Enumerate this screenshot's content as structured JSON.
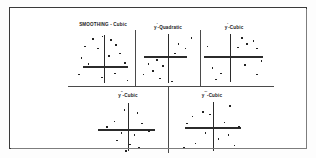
{
  "figure": {
    "kind": "trellis-scatter-panels",
    "panel_count": 5,
    "frame_color": "#3a3a3a",
    "point_color": "#222222",
    "axis_color": "#2b2b2b",
    "background": "#ffffff"
  },
  "chart_data": {
    "type": "scatter",
    "title": "SMOOTHING - Cubic",
    "xlabel": "",
    "ylabel": "",
    "grid": false,
    "legend": "none",
    "layout": "trellis 3 panels top row, 2 panels bottom row",
    "panels": [
      {
        "id": "panel-1",
        "title": "SMOOTHING - Cubic",
        "title_base": "SMOOTHING",
        "title_separator": " - ",
        "title_suffix": "Cubic",
        "primes": "",
        "axis_origin": {
          "x": 0.52,
          "y": 0.66
        },
        "axis_h_extent": [
          0.18,
          0.9
        ],
        "axis_v_extent": [
          0.05,
          0.98
        ],
        "points": [
          {
            "x": 0.33,
            "y": 0.12
          },
          {
            "x": 0.48,
            "y": 0.07
          },
          {
            "x": 0.62,
            "y": 0.14
          },
          {
            "x": 0.2,
            "y": 0.26
          },
          {
            "x": 0.41,
            "y": 0.3
          },
          {
            "x": 0.7,
            "y": 0.23
          },
          {
            "x": 0.14,
            "y": 0.48
          },
          {
            "x": 0.58,
            "y": 0.45
          },
          {
            "x": 0.76,
            "y": 0.4
          },
          {
            "x": 0.25,
            "y": 0.6
          },
          {
            "x": 0.84,
            "y": 0.58
          },
          {
            "x": 0.1,
            "y": 0.8
          },
          {
            "x": 0.47,
            "y": 0.86
          },
          {
            "x": 0.68,
            "y": 0.78
          },
          {
            "x": 0.88,
            "y": 0.92
          }
        ]
      },
      {
        "id": "panel-2",
        "title": "y'-Quadratic",
        "title_base": "y",
        "title_separator": "-",
        "title_suffix": "Quadratic",
        "primes": "'",
        "axis_origin": {
          "x": 0.5,
          "y": 0.46
        },
        "axis_h_extent": [
          0.1,
          0.82
        ],
        "axis_v_extent": [
          0.04,
          0.99
        ],
        "points": [
          {
            "x": 0.88,
            "y": 0.1
          },
          {
            "x": 0.66,
            "y": 0.22
          },
          {
            "x": 0.78,
            "y": 0.3
          },
          {
            "x": 0.6,
            "y": 0.4
          },
          {
            "x": 0.3,
            "y": 0.52
          },
          {
            "x": 0.16,
            "y": 0.6
          },
          {
            "x": 0.4,
            "y": 0.64
          },
          {
            "x": 0.24,
            "y": 0.74
          },
          {
            "x": 0.08,
            "y": 0.8
          },
          {
            "x": 0.35,
            "y": 0.88
          },
          {
            "x": 0.55,
            "y": 0.94
          }
        ]
      },
      {
        "id": "panel-3",
        "title": "y'-Cubic",
        "title_base": "y",
        "title_separator": "-",
        "title_suffix": "Cubic",
        "primes": "'",
        "axis_origin": {
          "x": 0.44,
          "y": 0.46
        },
        "axis_h_extent": [
          0.02,
          0.96
        ],
        "axis_v_extent": [
          0.04,
          0.96
        ],
        "points": [
          {
            "x": 0.62,
            "y": 0.1
          },
          {
            "x": 0.8,
            "y": 0.16
          },
          {
            "x": 0.7,
            "y": 0.22
          },
          {
            "x": 0.55,
            "y": 0.28
          },
          {
            "x": 0.86,
            "y": 0.3
          },
          {
            "x": 0.06,
            "y": 0.26
          },
          {
            "x": 0.93,
            "y": 0.54
          },
          {
            "x": 0.66,
            "y": 0.62
          },
          {
            "x": 0.14,
            "y": 0.68
          },
          {
            "x": 0.28,
            "y": 0.78
          },
          {
            "x": 0.86,
            "y": 0.8
          },
          {
            "x": 0.2,
            "y": 0.9
          }
        ]
      },
      {
        "id": "panel-4",
        "title": "y''-Cubic",
        "title_base": "y",
        "title_separator": "-",
        "title_suffix": "Cubic",
        "primes": "''",
        "axis_origin": {
          "x": 0.5,
          "y": 0.56
        },
        "axis_h_extent": [
          0.08,
          0.88
        ],
        "axis_v_extent": [
          0.06,
          0.98
        ],
        "points": [
          {
            "x": 0.44,
            "y": 0.18
          },
          {
            "x": 0.62,
            "y": 0.24
          },
          {
            "x": 0.3,
            "y": 0.4
          },
          {
            "x": 0.68,
            "y": 0.44
          },
          {
            "x": 0.2,
            "y": 0.5
          },
          {
            "x": 0.4,
            "y": 0.62
          },
          {
            "x": 0.58,
            "y": 0.66
          },
          {
            "x": 0.78,
            "y": 0.58
          },
          {
            "x": 0.34,
            "y": 0.76
          },
          {
            "x": 0.52,
            "y": 0.84
          },
          {
            "x": 0.64,
            "y": 0.9
          },
          {
            "x": 0.46,
            "y": 0.96
          }
        ]
      },
      {
        "id": "panel-5",
        "title": "y'''-Cubic",
        "title_base": "y",
        "title_separator": "-",
        "title_suffix": "Cubic",
        "primes": "'''",
        "axis_origin": {
          "x": 0.52,
          "y": 0.52
        },
        "axis_h_extent": [
          0.12,
          0.9
        ],
        "axis_v_extent": [
          0.04,
          0.98
        ],
        "points": [
          {
            "x": 0.74,
            "y": 0.1
          },
          {
            "x": 0.36,
            "y": 0.22
          },
          {
            "x": 0.22,
            "y": 0.3
          },
          {
            "x": 0.46,
            "y": 0.26
          },
          {
            "x": 0.14,
            "y": 0.44
          },
          {
            "x": 0.66,
            "y": 0.42
          },
          {
            "x": 0.86,
            "y": 0.5
          },
          {
            "x": 0.4,
            "y": 0.62
          },
          {
            "x": 0.72,
            "y": 0.66
          },
          {
            "x": 0.58,
            "y": 0.74
          },
          {
            "x": 0.26,
            "y": 0.82
          },
          {
            "x": 0.8,
            "y": 0.86
          },
          {
            "x": 0.1,
            "y": 0.9
          }
        ]
      }
    ]
  }
}
